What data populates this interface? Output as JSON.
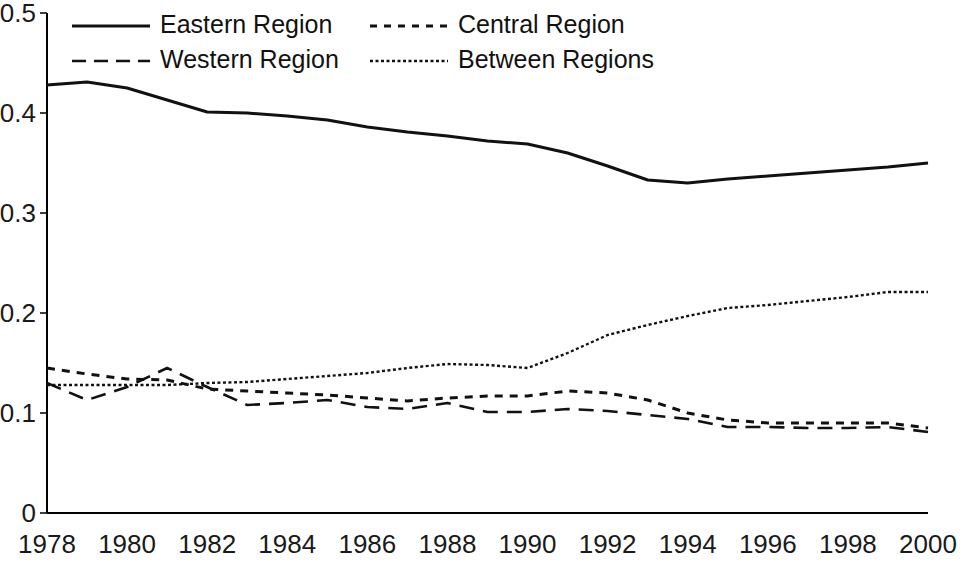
{
  "chart_data": {
    "type": "line",
    "title": "",
    "subtitle": "",
    "xlabel": "",
    "ylabel": "",
    "xlim": [
      1978,
      2000
    ],
    "ylim": [
      0,
      0.5
    ],
    "grid": false,
    "legend_position": "top-inside",
    "x_ticks": [
      "1978",
      "1980",
      "1982",
      "1984",
      "1986",
      "1988",
      "1990",
      "1992",
      "1994",
      "1996",
      "1998",
      "2000"
    ],
    "x_tick_values": [
      1978,
      1980,
      1982,
      1984,
      1986,
      1988,
      1990,
      1992,
      1994,
      1996,
      1998,
      2000
    ],
    "y_ticks": [
      "0",
      "0.1",
      "0.2",
      "0.3",
      "0.4",
      "0.5"
    ],
    "y_tick_values": [
      0,
      0.1,
      0.2,
      0.3,
      0.4,
      0.5
    ],
    "x": [
      1978,
      1979,
      1980,
      1981,
      1982,
      1983,
      1984,
      1985,
      1986,
      1987,
      1988,
      1989,
      1990,
      1991,
      1992,
      1993,
      1994,
      1995,
      1996,
      1997,
      1998,
      1999,
      2000
    ],
    "series": [
      {
        "name": "Eastern Region",
        "style": "solid",
        "color": "#111111",
        "width": 3.0,
        "dash": "",
        "values": [
          0.428,
          0.431,
          0.425,
          0.413,
          0.401,
          0.4,
          0.397,
          0.393,
          0.386,
          0.381,
          0.377,
          0.372,
          0.369,
          0.36,
          0.347,
          0.333,
          0.33,
          0.334,
          0.337,
          0.34,
          0.343,
          0.346,
          0.35
        ]
      },
      {
        "name": "Central Region",
        "style": "dotted",
        "color": "#111111",
        "width": 3.0,
        "dash": "8 7",
        "values": [
          0.145,
          0.139,
          0.134,
          0.133,
          0.124,
          0.122,
          0.12,
          0.118,
          0.115,
          0.112,
          0.115,
          0.117,
          0.117,
          0.122,
          0.12,
          0.113,
          0.1,
          0.093,
          0.09,
          0.09,
          0.09,
          0.09,
          0.085
        ]
      },
      {
        "name": "Western Region",
        "style": "dashed",
        "color": "#111111",
        "width": 2.6,
        "dash": "15 9",
        "values": [
          0.13,
          0.113,
          0.126,
          0.145,
          0.126,
          0.108,
          0.11,
          0.113,
          0.106,
          0.104,
          0.11,
          0.101,
          0.101,
          0.104,
          0.102,
          0.098,
          0.094,
          0.086,
          0.086,
          0.085,
          0.085,
          0.086,
          0.081
        ]
      },
      {
        "name": "Between Regions",
        "style": "fine-dotted",
        "color": "#111111",
        "width": 2.4,
        "dash": "3 2.5",
        "values": [
          0.128,
          0.128,
          0.128,
          0.128,
          0.13,
          0.131,
          0.134,
          0.137,
          0.14,
          0.145,
          0.149,
          0.148,
          0.145,
          0.16,
          0.178,
          0.188,
          0.197,
          0.205,
          0.208,
          0.212,
          0.216,
          0.221,
          0.221
        ]
      }
    ]
  },
  "legend": {
    "entries": [
      {
        "label": "Eastern Region",
        "dash": "",
        "width": 3.0
      },
      {
        "label": "Central Region",
        "dash": "7 7",
        "width": 3.0
      },
      {
        "label": "Western Region",
        "dash": "14 8",
        "width": 2.6
      },
      {
        "label": "Between Regions",
        "dash": "3 2.5",
        "width": 2.4
      }
    ]
  }
}
